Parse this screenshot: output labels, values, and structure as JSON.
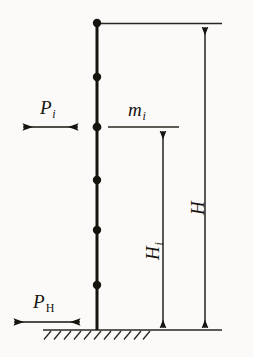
{
  "figure": {
    "type": "structural-engineering-diagram",
    "background_color": "#fbfaf8",
    "ink_color": "#16140f"
  },
  "labels": {
    "lateral_load_story": {
      "base": "P",
      "subscript": "i",
      "subscript_style": "italic"
    },
    "lateral_load_base": {
      "base": "P",
      "subscript": "H",
      "subscript_style": "upright"
    },
    "mass_story": {
      "base": "m",
      "subscript": "i",
      "subscript_style": "italic"
    },
    "height_story": {
      "base": "H",
      "subscript": "i",
      "subscript_style": "italic"
    },
    "height_total": {
      "base": "H",
      "subscript": "",
      "subscript_style": "italic"
    }
  },
  "geometry": {
    "column": {
      "x": 97,
      "y_top": 23,
      "y_base": 330,
      "stroke_width": 3
    },
    "nodes": [
      {
        "x": 97,
        "y": 23,
        "r": 3.6
      },
      {
        "x": 97,
        "y": 77,
        "r": 3.6
      },
      {
        "x": 97,
        "y": 127,
        "r": 3.8
      },
      {
        "x": 97,
        "y": 180,
        "r": 3.6
      },
      {
        "x": 97,
        "y": 230,
        "r": 3.6
      },
      {
        "x": 97,
        "y": 285,
        "r": 3.6
      }
    ],
    "ground_line": {
      "y": 330,
      "x_start": 43,
      "x_end": 222
    },
    "hatching": {
      "y": 330,
      "x_start": 44,
      "x_end": 150,
      "count": 11,
      "length": 9,
      "angle_deg": 50
    },
    "arrow_p_i": {
      "y": 127,
      "x_start": 22,
      "x_end": 79,
      "heads": "both"
    },
    "arrow_p_h": {
      "y": 322,
      "x_start": 13,
      "x_end": 81,
      "heads": "both"
    },
    "mass_line": {
      "y": 127,
      "x_start": 108,
      "x_end": 179
    },
    "dim_h_i": {
      "x": 163,
      "y_top": 130,
      "y_bottom": 329,
      "heads": "both"
    },
    "dim_h_total": {
      "x": 205,
      "y_top": 26,
      "y_bottom": 329,
      "heads": "both"
    },
    "extension_top": {
      "y": 23,
      "x_start": 97,
      "x_end": 222
    }
  }
}
